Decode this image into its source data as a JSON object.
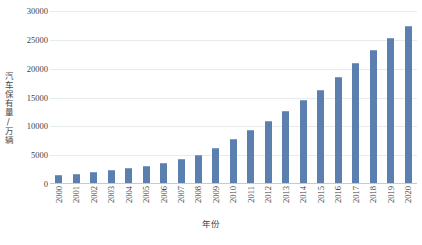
{
  "chart_data": {
    "type": "bar",
    "title": "",
    "xlabel": "年份",
    "ylabel": "汽车保有量/万辆",
    "ylim": [
      0,
      30000
    ],
    "grid": true,
    "legend": "none",
    "y_ticks": [
      0,
      5000,
      10000,
      15000,
      20000,
      25000,
      30000
    ],
    "y_tick_labels": [
      "0",
      "5000",
      "10000",
      "15000",
      "20000",
      "25000",
      "30000"
    ],
    "categories": [
      "2000",
      "2001",
      "2002",
      "2003",
      "2004",
      "2005",
      "2006",
      "2007",
      "2008",
      "2009",
      "2010",
      "2011",
      "2012",
      "2013",
      "2014",
      "2015",
      "2016",
      "2017",
      "2018",
      "2019",
      "2020"
    ],
    "values": [
      1609,
      1802,
      2053,
      2383,
      2694,
      3160,
      3697,
      4358,
      5099,
      6281,
      7802,
      9356,
      10933,
      12670,
      14599,
      16284,
      18574,
      20907,
      23231,
      25376,
      27341
    ],
    "bar_color": "#5b80b0",
    "grid_color": "#e6ebf0",
    "axis_color": "#c9c9c9",
    "background": "#ffffff"
  },
  "caption": {
    "text": ""
  }
}
